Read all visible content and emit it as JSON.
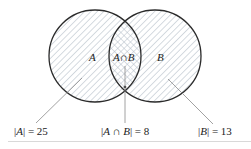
{
  "diagram": {
    "type": "venn",
    "sets": [
      {
        "id": "A",
        "label": "A",
        "cardinality_label": "|A| = 25",
        "count": 25
      },
      {
        "id": "B",
        "label": "B",
        "cardinality_label": "|B| = 13",
        "count": 13
      }
    ],
    "intersection": {
      "label": "A∩B",
      "cardinality_label": "|A ∩ B| = 8",
      "count": 8
    },
    "labels": {
      "set_a": "A",
      "set_b": "B",
      "intersection": "A∩B",
      "count_a_prefix": "|",
      "count_a_var": "A",
      "count_a_suffix": "| = 25",
      "count_ab_prefix": "|",
      "count_ab_var": "A ∩ B",
      "count_ab_suffix": "| = 8",
      "count_b_prefix": "|",
      "count_b_var": "B",
      "count_b_suffix": "| = 13"
    },
    "colors": {
      "stroke": "#2b2b2b",
      "hatch": "#b9c3cc",
      "leader": "#8a8a8a",
      "separator": "#d9d9d9",
      "text": "#222222"
    }
  }
}
